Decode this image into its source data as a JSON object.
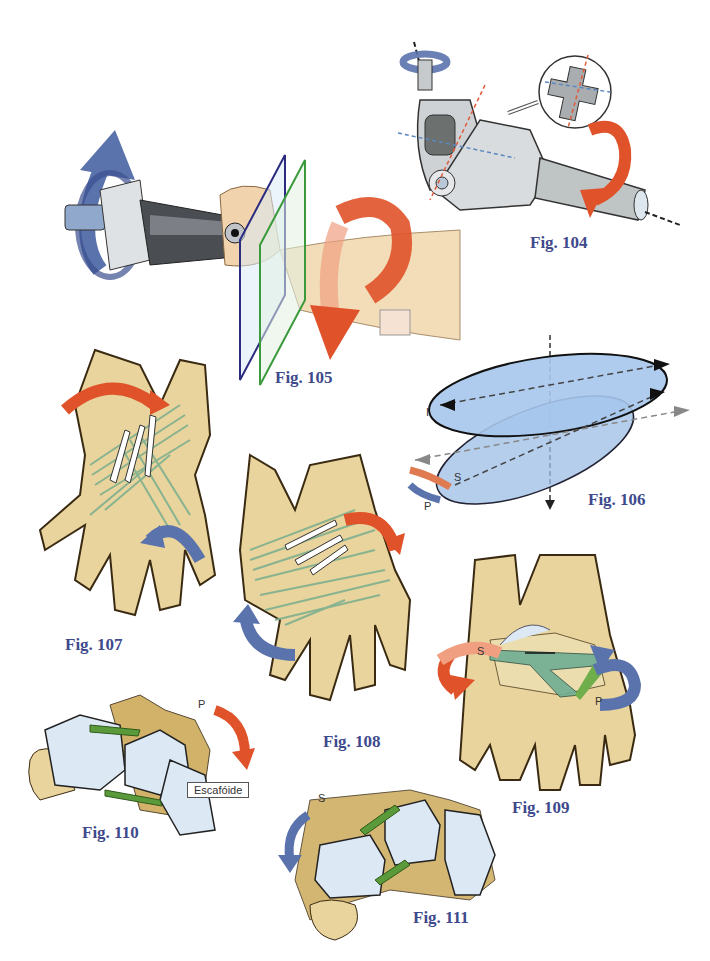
{
  "page": {
    "background": "#ffffff",
    "caption_color": "#3e4a8c"
  },
  "figures": [
    {
      "id": "104",
      "caption": "Fig. 104",
      "subject": "universal-joint-cardan-mechanism",
      "labels": []
    },
    {
      "id": "105",
      "caption": "Fig. 105",
      "subject": "forearm-hand-rotation-with-planes",
      "labels": []
    },
    {
      "id": "106",
      "caption": "Fig. 106",
      "subject": "ellipsoid-articular-surfaces",
      "labels": [
        "I",
        "S",
        "P"
      ]
    },
    {
      "id": "107",
      "caption": "Fig. 107",
      "subject": "carpal-ligaments-dorsal-view",
      "labels": []
    },
    {
      "id": "108",
      "caption": "Fig. 108",
      "subject": "carpal-ligaments-palmar-view",
      "labels": []
    },
    {
      "id": "109",
      "caption": "Fig. 109",
      "subject": "carpus-rotation-supination-pronation",
      "labels": [
        "S",
        "P"
      ]
    },
    {
      "id": "110",
      "caption": "Fig. 110",
      "subject": "carpal-row-pronation",
      "labels": [
        "P"
      ],
      "callout": "Escafóide"
    },
    {
      "id": "111",
      "caption": "Fig. 111",
      "subject": "carpal-row-supination",
      "labels": [
        "S"
      ]
    }
  ],
  "colors": {
    "bone": "#e8d49c",
    "bone_dark": "#c9a54e",
    "bone_outline": "#3a2a12",
    "ligament": "#8fbf9f",
    "cartilage": "#dce9f5",
    "arrow_red": "#e0522a",
    "arrow_blue": "#5b73ad",
    "ellipsoid": "#9bbde6",
    "metal": "#b8bcc0",
    "skin": "#f3dcb8"
  }
}
